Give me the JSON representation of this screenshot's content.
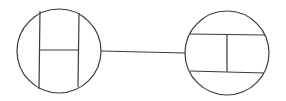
{
  "diagram": {
    "background": "#ffffff",
    "stroke_color": "#3a3a3a",
    "nodes": [
      {
        "id": "left-circle",
        "cx": 59,
        "cy": 51,
        "r": 42,
        "inner_lines": [
          {
            "x1": 40,
            "y1": 11,
            "x2": 39,
            "y2": 89
          },
          {
            "x1": 79,
            "y1": 13,
            "x2": 78,
            "y2": 87
          },
          {
            "x1": 40,
            "y1": 50,
            "x2": 79,
            "y2": 50
          }
        ]
      },
      {
        "id": "right-circle",
        "cx": 227,
        "cy": 53,
        "r": 42,
        "inner_lines": [
          {
            "x1": 190,
            "y1": 34,
            "x2": 265,
            "y2": 35
          },
          {
            "x1": 190,
            "y1": 71,
            "x2": 264,
            "y2": 73
          },
          {
            "x1": 227,
            "y1": 34,
            "x2": 227,
            "y2": 72
          }
        ]
      }
    ],
    "edges": [
      {
        "from": "left-circle",
        "to": "right-circle",
        "x1": 101,
        "y1": 51,
        "x2": 185,
        "y2": 53
      }
    ]
  }
}
